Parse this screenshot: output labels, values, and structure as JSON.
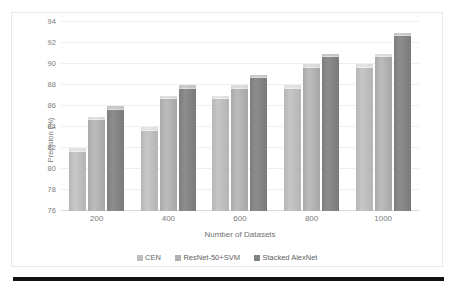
{
  "chart_data": {
    "type": "bar",
    "title": "",
    "xlabel": "Number of Datasets",
    "ylabel": "Precision (%)",
    "categories": [
      "200",
      "400",
      "600",
      "800",
      "1000"
    ],
    "ylim": [
      76,
      94
    ],
    "yticks": [
      76,
      78,
      80,
      82,
      84,
      86,
      88,
      90,
      92,
      94
    ],
    "grid": "horizontal",
    "legend_position": "bottom",
    "series": [
      {
        "name": "CEN",
        "color": "#bfbfbf",
        "values": [
          82,
          84,
          87,
          88,
          90
        ]
      },
      {
        "name": "ResNet-50+SVM",
        "color": "#b0b0b0",
        "values": [
          85,
          87,
          88,
          90,
          91
        ]
      },
      {
        "name": "Stacked AlexNet",
        "color": "#828282",
        "values": [
          86,
          88,
          89,
          91,
          93
        ]
      }
    ]
  },
  "axes": {
    "y_title": "Precision (%)",
    "x_title": "Number of Datasets",
    "y_tick_labels": [
      "94",
      "92",
      "90",
      "88",
      "86",
      "84",
      "82",
      "80",
      "78",
      "76"
    ],
    "x_tick_labels": [
      "200",
      "400",
      "600",
      "800",
      "1000"
    ]
  },
  "legend": {
    "items": [
      {
        "label": "CEN"
      },
      {
        "label": "ResNet-50+SVM"
      },
      {
        "label": "Stacked AlexNet"
      }
    ]
  }
}
